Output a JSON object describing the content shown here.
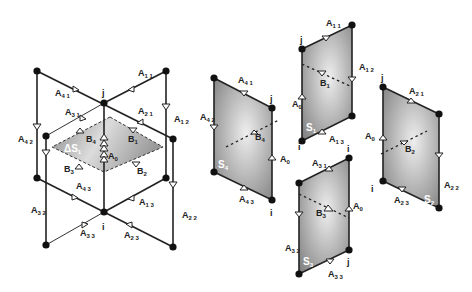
{
  "figure": {
    "type": "geometric-mesh-decomposition-diagram",
    "left_panel": {
      "center_nodes": {
        "top": "j",
        "bottom": "i"
      },
      "surface_label": "ΔS",
      "surface_sub": "1",
      "edge_labels": [
        {
          "id": "A11",
          "text": "A",
          "sub": "1 1"
        },
        {
          "id": "A12",
          "text": "A",
          "sub": "1 2"
        },
        {
          "id": "A13",
          "text": "A",
          "sub": "1 3"
        },
        {
          "id": "A21",
          "text": "A",
          "sub": "2 1"
        },
        {
          "id": "A22",
          "text": "A",
          "sub": "2 2"
        },
        {
          "id": "A23",
          "text": "A",
          "sub": "2 3"
        },
        {
          "id": "A31",
          "text": "A",
          "sub": "3 1"
        },
        {
          "id": "A32",
          "text": "A",
          "sub": "3 2"
        },
        {
          "id": "A33",
          "text": "A",
          "sub": "3 3"
        },
        {
          "id": "A41",
          "text": "A",
          "sub": "4 1"
        },
        {
          "id": "A42",
          "text": "A",
          "sub": "4 2"
        },
        {
          "id": "A43",
          "text": "A",
          "sub": "4 3"
        },
        {
          "id": "A0",
          "text": "A",
          "sub": "0"
        }
      ],
      "boundary_labels": [
        {
          "id": "B1",
          "text": "B",
          "sub": "1"
        },
        {
          "id": "B2",
          "text": "B",
          "sub": "2"
        },
        {
          "id": "B3",
          "text": "B",
          "sub": "3"
        },
        {
          "id": "B4",
          "text": "B",
          "sub": "4"
        }
      ]
    },
    "right_panels": [
      {
        "id": "S4",
        "surface": "S",
        "sub": "4",
        "node_top": "j",
        "node_bottom": "i",
        "labels": [
          "A41",
          "A42",
          "A43",
          "A0",
          "B4"
        ]
      },
      {
        "id": "S1",
        "surface": "S",
        "sub": "1",
        "node_top": "j",
        "node_bottom": "i",
        "labels": [
          "A11",
          "A12",
          "A13",
          "A0",
          "B1"
        ]
      },
      {
        "id": "S3",
        "surface": "S",
        "sub": "3",
        "node_top": "i",
        "node_bottom": "j",
        "labels": [
          "A31",
          "A32",
          "A33",
          "A0",
          "B3"
        ]
      },
      {
        "id": "S2",
        "surface": "S",
        "sub": "2",
        "node_top": "j",
        "node_bottom": "i",
        "labels": [
          "A21",
          "A22",
          "A23",
          "A0",
          "B2"
        ]
      }
    ]
  },
  "text": {
    "A": "A",
    "B": "B",
    "S": "S",
    "dS": "ΔS",
    "i": "i",
    "j": "j",
    "s11": "1 1",
    "s12": "1 2",
    "s13": "1 3",
    "s21": "2 1",
    "s22": "2 2",
    "s23": "2 3",
    "s31": "3 1",
    "s32": "3 2",
    "s33": "3 3",
    "s41": "4 1",
    "s42": "4 2",
    "s43": "4 3",
    "s0": "0",
    "s1": "1",
    "s2": "2",
    "s3": "3",
    "s4": "4"
  },
  "colors": {
    "line": "#222222",
    "surface_dark": "#8a8a8a",
    "surface_light": "#e6e6e6",
    "background": "#ffffff"
  }
}
